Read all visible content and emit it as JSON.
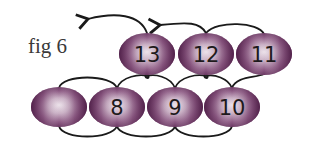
{
  "figure": {
    "label": "fig 6",
    "colors": {
      "bead_dark": "#5e2a55",
      "bead_mid": "#9a6a90",
      "bead_light": "#e6dae3",
      "thread": "#1a1a1a"
    },
    "top_row": [
      {
        "id": "bead-13",
        "label": "13",
        "cx": 147,
        "cy": 54
      },
      {
        "id": "bead-12",
        "label": "12",
        "cx": 206,
        "cy": 54
      },
      {
        "id": "bead-11",
        "label": "11",
        "cx": 264,
        "cy": 54
      }
    ],
    "bottom_row": [
      {
        "id": "bead-blank",
        "label": "",
        "cx": 59,
        "cy": 107
      },
      {
        "id": "bead-8",
        "label": "8",
        "cx": 117,
        "cy": 107
      },
      {
        "id": "bead-9",
        "label": "9",
        "cx": 175,
        "cy": 107
      },
      {
        "id": "bead-10",
        "label": "10",
        "cx": 232,
        "cy": 107
      }
    ]
  }
}
